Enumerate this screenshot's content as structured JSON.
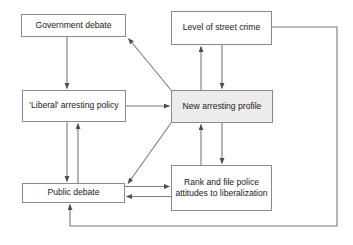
{
  "diagram": {
    "type": "flow-diagram",
    "canvas": {
      "width": 353,
      "height": 245,
      "background": "#ffffff"
    },
    "style": {
      "node_border": "#8a8a8a",
      "node_fill": "#ffffff",
      "node_fill_shaded": "#ececec",
      "edge_color": "#6f6f6f",
      "text_color": "#1a1a1a"
    },
    "nodes": [
      {
        "id": "government-debate",
        "label": "Government debate",
        "x": 21,
        "y": 14,
        "w": 105,
        "h": 23,
        "shaded": false
      },
      {
        "id": "level-of-street-crime",
        "label": "Level of street crime",
        "x": 171,
        "y": 11,
        "w": 101,
        "h": 34,
        "shaded": false
      },
      {
        "id": "liberal-arresting-policy",
        "label": "'Liberal' arresting policy",
        "x": 22,
        "y": 90,
        "w": 104,
        "h": 32,
        "shaded": false
      },
      {
        "id": "new-arresting-profile",
        "label": "New arresting profile",
        "x": 171,
        "y": 90,
        "w": 102,
        "h": 33,
        "shaded": true
      },
      {
        "id": "public-debate",
        "label": "Public debate",
        "x": 22,
        "y": 183,
        "w": 103,
        "h": 20,
        "shaded": false
      },
      {
        "id": "rank-and-file-police",
        "label": "Rank and file police attitudes to liberalization",
        "x": 171,
        "y": 165,
        "w": 101,
        "h": 46,
        "shaded": false
      }
    ],
    "edges": [
      {
        "id": "government-to-liberal",
        "from": "government-debate",
        "to": "liberal-arresting-policy",
        "kind": "vertical-down"
      },
      {
        "id": "liberal-to-new-profile",
        "from": "liberal-arresting-policy",
        "to": "new-arresting-profile",
        "kind": "horizontal-right"
      },
      {
        "id": "new-profile-to-government",
        "from": "new-arresting-profile",
        "to": "government-debate",
        "kind": "diagonal-up-left"
      },
      {
        "id": "new-profile-to-public",
        "from": "new-arresting-profile",
        "to": "public-debate",
        "kind": "diagonal-down-left"
      },
      {
        "id": "liberal-to-public",
        "from": "liberal-arresting-policy",
        "to": "public-debate",
        "kind": "vertical-down"
      },
      {
        "id": "public-to-liberal",
        "from": "public-debate",
        "to": "liberal-arresting-policy",
        "kind": "vertical-up"
      },
      {
        "id": "public-to-rank",
        "from": "public-debate",
        "to": "rank-and-file-police",
        "kind": "horizontal-right"
      },
      {
        "id": "rank-to-public",
        "from": "rank-and-file-police",
        "to": "public-debate",
        "kind": "horizontal-left"
      },
      {
        "id": "new-profile-to-crime",
        "from": "new-arresting-profile",
        "to": "level-of-street-crime",
        "kind": "vertical-up"
      },
      {
        "id": "crime-to-new-profile",
        "from": "level-of-street-crime",
        "to": "new-arresting-profile",
        "kind": "vertical-down"
      },
      {
        "id": "rank-to-new-profile",
        "from": "rank-and-file-police",
        "to": "new-arresting-profile",
        "kind": "vertical-up"
      },
      {
        "id": "new-profile-to-rank",
        "from": "new-arresting-profile",
        "to": "rank-and-file-police",
        "kind": "vertical-down"
      },
      {
        "id": "crime-to-public-feedback",
        "from": "level-of-street-crime",
        "to": "public-debate",
        "kind": "right-bottom-loop"
      }
    ]
  }
}
